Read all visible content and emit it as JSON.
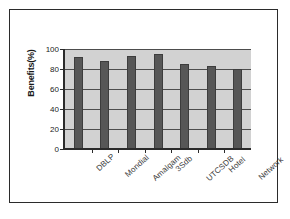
{
  "chart_data": {
    "type": "bar",
    "title": "",
    "xlabel": "",
    "ylabel": "Benefits(%)",
    "categories": [
      "DBLP",
      "Mondial",
      "Amalgam",
      "3Sdb",
      "UTCSDB",
      "Hotel",
      "Network"
    ],
    "values": [
      92,
      88,
      93,
      95,
      85,
      83,
      80
    ],
    "ylim": [
      0,
      100
    ],
    "yticks": [
      0,
      20,
      40,
      60,
      80,
      100
    ],
    "ytick_labels": [
      "0",
      "20",
      "40",
      "60",
      "80",
      "100"
    ],
    "grid": true,
    "legend": false,
    "series": [
      {
        "name": "Benefits",
        "values": [
          92,
          88,
          93,
          95,
          85,
          83,
          80
        ],
        "color": "#575757"
      }
    ],
    "colors": {
      "bar_fill": "#575757",
      "bar_edge": "#3d3d3d",
      "plot_background": "#d2d2d2",
      "gridline": "#4d4d4d",
      "axis": "#2b2b2b",
      "figure_border": "#2b2b2b",
      "figure_background": "#ffffff",
      "text": "#1a1a1a"
    }
  }
}
